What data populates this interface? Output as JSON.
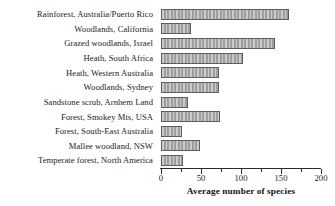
{
  "chart_data": {
    "type": "bar",
    "orientation": "horizontal",
    "title": "",
    "xlabel": "Average number of species",
    "ylabel": "",
    "xlim": [
      0,
      200
    ],
    "grid": false,
    "legend": null,
    "xticks": [
      0,
      50,
      100,
      150,
      200
    ],
    "xticklabels": [
      "0",
      "50",
      "100",
      "150",
      "200"
    ],
    "xminorticks": [
      25,
      75,
      125,
      175
    ],
    "categories": [
      "Rainforest, Australia/Puerto Rico",
      "Woodlands, California",
      "Grazed woodlands, Israel",
      "Heath, South Africa",
      "Heath, Western Australia",
      "Woodlands, Sydney",
      "Sandstone scrub, Arnhem Land",
      "Forest, Smokey Mts, USA",
      "Forest, South-East Australia",
      "Mallee woodland, NSW",
      "Temperate forest, North America"
    ],
    "values": [
      160,
      37,
      143,
      102,
      72,
      72,
      34,
      74,
      26,
      49,
      28
    ],
    "bar_color": "#a6a6a6",
    "bar_edge_color": "#5e5e5e",
    "axis_color": "#2b2b2b",
    "background_color": "#ffffff"
  }
}
